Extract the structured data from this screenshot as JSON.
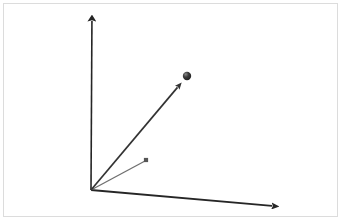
{
  "figure": {
    "title": "3D coordinate axes with vectors",
    "width": 341,
    "height": 220,
    "background_color": "#ffffff",
    "border_color": "#dcdcdc",
    "border_inset_px": 3
  },
  "chart_data": {
    "type": "scatter",
    "title": "3D coordinate axes with vectors",
    "subtitle": "",
    "xlabel": "",
    "ylabel": "",
    "grid": false,
    "legend": "none",
    "projection": "3d-oblique",
    "origin": {
      "x": 91,
      "y": 190
    },
    "axes": [
      {
        "name": "vertical-axis",
        "label": "",
        "color": "#262626",
        "width": 1.6,
        "arrow": true,
        "from": {
          "x": 91,
          "y": 190
        },
        "to": {
          "x": 92,
          "y": 9
        }
      },
      {
        "name": "horizontal-axis",
        "label": "",
        "color": "#262626",
        "width": 1.8,
        "arrow": true,
        "from": {
          "x": 91,
          "y": 190
        },
        "to": {
          "x": 284,
          "y": 207
        }
      }
    ],
    "vectors": [
      {
        "name": "primary-vector",
        "label": "",
        "color": "#333333",
        "width": 1.7,
        "arrow": true,
        "from": {
          "x": 91,
          "y": 190
        },
        "to": {
          "x": 182,
          "y": 82
        },
        "endpoint_marker": {
          "type": "sphere",
          "x": 187,
          "y": 76,
          "radius": 4.2,
          "color": "#2b2b2b",
          "highlight_color": "#8a8a8a"
        }
      },
      {
        "name": "secondary-vector",
        "label": "",
        "color": "#6f6f6f",
        "width": 1.3,
        "arrow": false,
        "from": {
          "x": 91,
          "y": 190
        },
        "to": {
          "x": 145,
          "y": 161
        },
        "endpoint_marker": {
          "type": "square",
          "x": 146,
          "y": 160,
          "radius": 2.1,
          "color": "#555555",
          "highlight_color": "#555555"
        }
      }
    ],
    "annotations": [],
    "tick_labels": {
      "x": [],
      "y": [],
      "z": []
    }
  }
}
